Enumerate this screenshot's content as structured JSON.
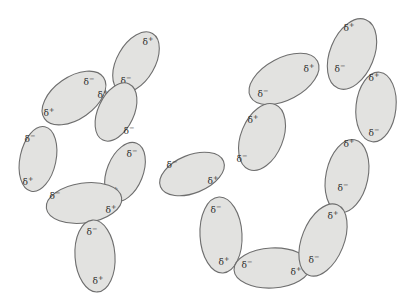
{
  "figure": {
    "background_color": "#ffffff",
    "fill_color": "#e2e2e0",
    "stroke_color": "#6e6e6e",
    "label_color": "#2b2b2b",
    "positive_label": "δ",
    "positive_sign": "+",
    "negative_label": "δ",
    "negative_sign": "−",
    "dipoles": [
      {
        "id": "dipole-1",
        "cx": 74,
        "cy": 98,
        "rx": 36,
        "ry": 21,
        "rotation": -35,
        "plus": {
          "x": 49,
          "y": 113
        },
        "minus": {
          "x": 89,
          "y": 82
        }
      },
      {
        "id": "dipole-2",
        "cx": 136,
        "cy": 62,
        "rx": 33,
        "ry": 19,
        "rotation": -60,
        "plus": {
          "x": 148,
          "y": 42
        },
        "minus": {
          "x": 126,
          "y": 81
        }
      },
      {
        "id": "dipole-3",
        "cx": 116,
        "cy": 112,
        "rx": 31,
        "ry": 18,
        "rotation": -65,
        "plus": {
          "x": 103,
          "y": 95
        },
        "minus": {
          "x": 129,
          "y": 131
        }
      },
      {
        "id": "dipole-4",
        "cx": 38,
        "cy": 159,
        "rx": 33,
        "ry": 18,
        "rotation": -78,
        "plus": {
          "x": 28,
          "y": 182
        },
        "minus": {
          "x": 30,
          "y": 139
        }
      },
      {
        "id": "dipole-5",
        "cx": 125,
        "cy": 172,
        "rx": 31,
        "ry": 18,
        "rotation": -68,
        "plus": {
          "x": 113,
          "y": 192
        },
        "minus": {
          "x": 132,
          "y": 154
        }
      },
      {
        "id": "dipole-6",
        "cx": 84,
        "cy": 203,
        "rx": 38,
        "ry": 20,
        "rotation": -8,
        "plus": {
          "x": 111,
          "y": 210
        },
        "minus": {
          "x": 55,
          "y": 196
        }
      },
      {
        "id": "dipole-7",
        "cx": 95,
        "cy": 256,
        "rx": 20,
        "ry": 36,
        "rotation": -4,
        "plus": {
          "x": 98,
          "y": 281
        },
        "minus": {
          "x": 92,
          "y": 232
        }
      },
      {
        "id": "dipole-8",
        "cx": 192,
        "cy": 174,
        "rx": 34,
        "ry": 19,
        "rotation": -22,
        "plus": {
          "x": 213,
          "y": 181
        },
        "minus": {
          "x": 172,
          "y": 165
        }
      },
      {
        "id": "dipole-9",
        "cx": 221,
        "cy": 235,
        "rx": 21,
        "ry": 38,
        "rotation": -3,
        "plus": {
          "x": 224,
          "y": 262
        },
        "minus": {
          "x": 216,
          "y": 210
        }
      },
      {
        "id": "dipole-10",
        "cx": 272,
        "cy": 268,
        "rx": 38,
        "ry": 20,
        "rotation": -3,
        "plus": {
          "x": 296,
          "y": 272
        },
        "minus": {
          "x": 247,
          "y": 265
        }
      },
      {
        "id": "dipole-11",
        "cx": 284,
        "cy": 79,
        "rx": 38,
        "ry": 21,
        "rotation": -28,
        "plus": {
          "x": 309,
          "y": 69
        },
        "minus": {
          "x": 263,
          "y": 94
        }
      },
      {
        "id": "dipole-12",
        "cx": 262,
        "cy": 137,
        "rx": 21,
        "ry": 35,
        "rotation": 22,
        "plus": {
          "x": 253,
          "y": 120
        },
        "minus": {
          "x": 242,
          "y": 159
        }
      },
      {
        "id": "dipole-13",
        "cx": 352,
        "cy": 54,
        "rx": 22,
        "ry": 37,
        "rotation": 22,
        "plus": {
          "x": 349,
          "y": 28
        },
        "minus": {
          "x": 340,
          "y": 69
        }
      },
      {
        "id": "dipole-14",
        "cx": 376,
        "cy": 107,
        "rx": 20,
        "ry": 35,
        "rotation": 6,
        "plus": {
          "x": 374,
          "y": 78
        },
        "minus": {
          "x": 374,
          "y": 133
        }
      },
      {
        "id": "dipole-15",
        "cx": 347,
        "cy": 176,
        "rx": 21,
        "ry": 37,
        "rotation": 12,
        "plus": {
          "x": 349,
          "y": 144
        },
        "minus": {
          "x": 343,
          "y": 188
        }
      },
      {
        "id": "dipole-16",
        "cx": 323,
        "cy": 240,
        "rx": 21,
        "ry": 38,
        "rotation": 22,
        "plus": {
          "x": 333,
          "y": 216
        },
        "minus": {
          "x": 314,
          "y": 260
        }
      }
    ]
  }
}
